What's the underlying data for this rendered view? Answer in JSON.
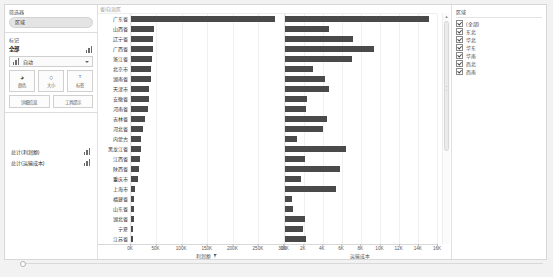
{
  "filters": {
    "title": "筛选器",
    "items": [
      {
        "label": "区域"
      }
    ]
  },
  "marks": {
    "title": "标记",
    "all_label": "全部",
    "type_label": "自动",
    "buttons": [
      {
        "icon": "color-icon",
        "glyph": "◕",
        "label": "颜色"
      },
      {
        "icon": "size-icon",
        "glyph": "○",
        "label": "大小"
      },
      {
        "icon": "label-icon",
        "glyph": "ᵀ",
        "label": "标签"
      }
    ],
    "shelves": [
      {
        "label": "详细信息"
      },
      {
        "label": "工具提示"
      }
    ]
  },
  "measures": [
    {
      "label": "总计(利润额)"
    },
    {
      "label": "总计(运输成本)"
    }
  ],
  "legend": {
    "title": "区域",
    "items": [
      {
        "label": "(全部)",
        "checked": true
      },
      {
        "label": "东北",
        "checked": true
      },
      {
        "label": "华北",
        "checked": true
      },
      {
        "label": "华东",
        "checked": true
      },
      {
        "label": "华南",
        "checked": true
      },
      {
        "label": "西北",
        "checked": true
      },
      {
        "label": "西南",
        "checked": true
      }
    ]
  },
  "chart_data": {
    "type": "bar",
    "title": "",
    "orientation": "horizontal",
    "row_header": "省/自治区",
    "categories": [
      "广东省",
      "山西省",
      "辽宁省",
      "广西省",
      "浙江省",
      "北京市",
      "湖南省",
      "天津市",
      "安徽省",
      "河南省",
      "吉林省",
      "河北省",
      "内蒙古",
      "黑龙江省",
      "江西省",
      "陕西省",
      "重庆市",
      "上海市",
      "福建省",
      "山东省",
      "湖北省",
      "宁夏",
      "江苏省"
    ],
    "series": [
      {
        "name": "利润额",
        "pane": "left",
        "xlabel": "利润额",
        "sorted": true,
        "ticks": [
          "0K",
          "50K",
          "100K",
          "150K",
          "200K",
          "250K",
          "300K"
        ],
        "xlim": [
          0,
          300000
        ],
        "values": [
          283000,
          46000,
          44000,
          43000,
          42000,
          39000,
          38500,
          36000,
          35000,
          34000,
          28000,
          23000,
          20000,
          19000,
          18000,
          16000,
          14500,
          8000,
          6500,
          6000,
          5500,
          4500,
          4000
        ]
      },
      {
        "name": "运输成本",
        "pane": "right",
        "xlabel": "运输成本",
        "sorted": false,
        "ticks": [
          "0K",
          "2K",
          "4K",
          "6K",
          "8K",
          "10K",
          "12K",
          "14K",
          "16K"
        ],
        "xlim": [
          0,
          16000
        ],
        "values": [
          15200,
          4700,
          7200,
          9400,
          7100,
          3000,
          4200,
          4700,
          2400,
          2300,
          4500,
          4000,
          1300,
          6500,
          2100,
          5800,
          1700,
          5400,
          800,
          900,
          2200,
          1900,
          2300
        ]
      }
    ],
    "grid": true,
    "legend_position": "right"
  }
}
